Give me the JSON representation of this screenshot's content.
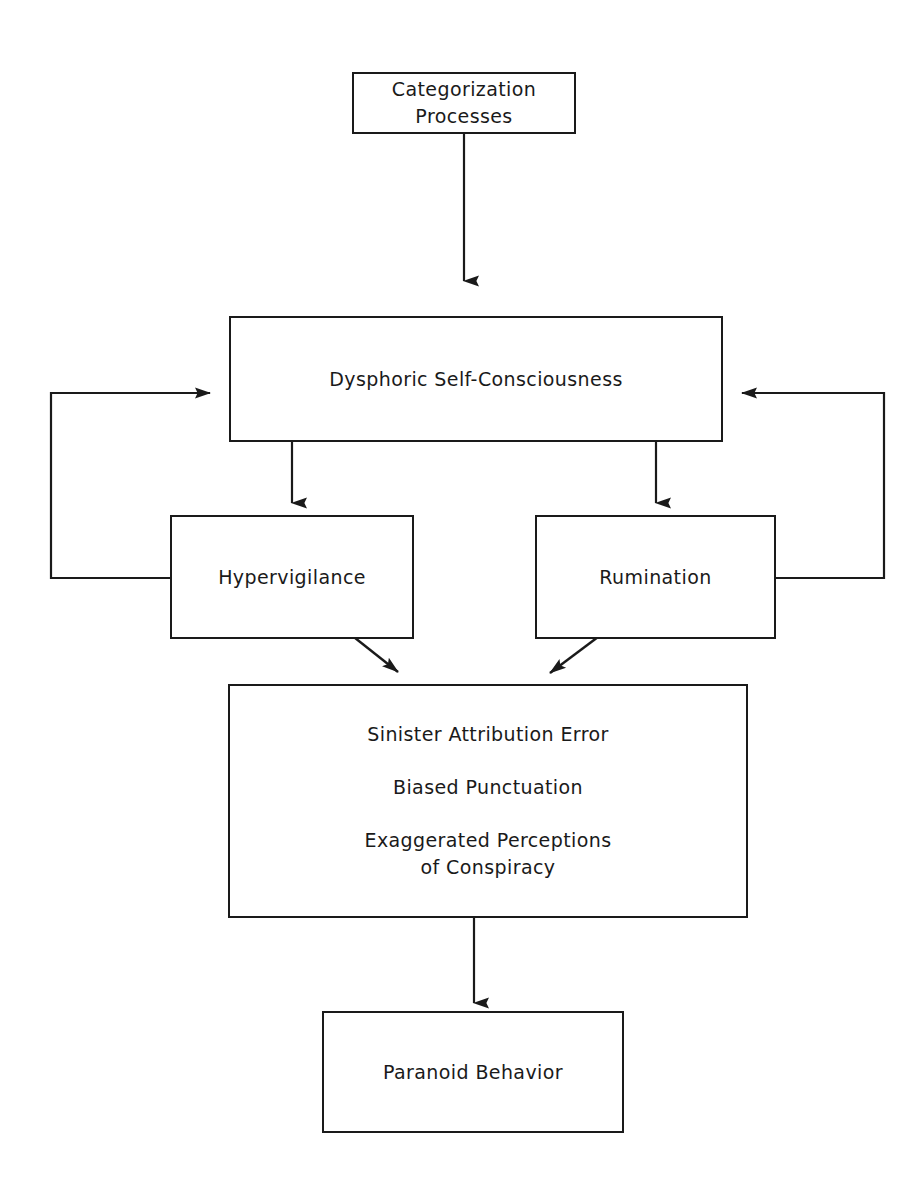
{
  "diagram": {
    "background_color": "#ffffff",
    "stroke_color": "#1a1a1a",
    "text_color": "#1a1a1a",
    "nodes": [
      {
        "id": "categorization",
        "lines": [
          "Categorization",
          "Processes"
        ],
        "line1": "Categorization",
        "line2": "Processes"
      },
      {
        "id": "dysphoric",
        "lines": [
          "Dysphoric Self-Consciousness"
        ],
        "line1": "Dysphoric Self-Consciousness"
      },
      {
        "id": "hypervigilance",
        "lines": [
          "Hypervigilance"
        ],
        "line1": "Hypervigilance"
      },
      {
        "id": "rumination",
        "lines": [
          "Rumination"
        ],
        "line1": "Rumination"
      },
      {
        "id": "attribution",
        "lines": [
          "Sinister Attribution Error",
          "Biased Punctuation",
          "Exaggerated Perceptions",
          "of Conspiracy"
        ],
        "line1": "Sinister Attribution Error",
        "line2": "Biased Punctuation",
        "line3": "Exaggerated Perceptions",
        "line4": "of Conspiracy"
      },
      {
        "id": "paranoid",
        "lines": [
          "Paranoid Behavior"
        ],
        "line1": "Paranoid Behavior"
      }
    ],
    "edges": [
      {
        "id": "categorization-to-dysphoric",
        "from": "categorization",
        "to": "dysphoric",
        "style": "straight-down",
        "arrowhead": true
      },
      {
        "id": "dysphoric-to-hypervigilance",
        "from": "dysphoric",
        "to": "hypervigilance",
        "style": "straight-down",
        "arrowhead": true
      },
      {
        "id": "dysphoric-to-rumination",
        "from": "dysphoric",
        "to": "rumination",
        "style": "straight-down",
        "arrowhead": true
      },
      {
        "id": "hypervigilance-to-attribution",
        "from": "hypervigilance",
        "to": "attribution",
        "style": "diagonal-down-right",
        "arrowhead": true
      },
      {
        "id": "rumination-to-attribution",
        "from": "rumination",
        "to": "attribution",
        "style": "diagonal-down-left",
        "arrowhead": true
      },
      {
        "id": "hypervigilance-to-dysphoric-feedback",
        "from": "hypervigilance",
        "to": "dysphoric",
        "style": "left-feedback-loop",
        "arrowhead": true
      },
      {
        "id": "rumination-to-dysphoric-feedback",
        "from": "rumination",
        "to": "dysphoric",
        "style": "right-feedback-loop",
        "arrowhead": true
      },
      {
        "id": "attribution-to-paranoid",
        "from": "attribution",
        "to": "paranoid",
        "style": "straight-down",
        "arrowhead": true
      }
    ]
  }
}
